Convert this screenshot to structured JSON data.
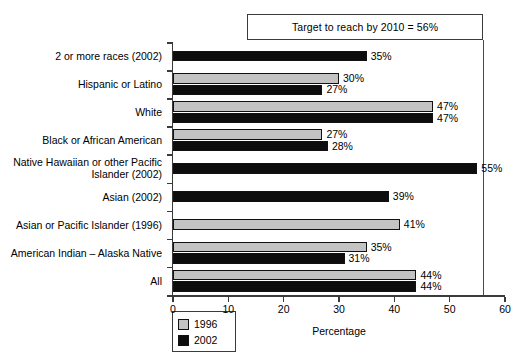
{
  "chart_data": {
    "type": "bar",
    "orientation": "horizontal",
    "title": "",
    "xlabel": "Percentage",
    "ylabel": "",
    "xlim": [
      0,
      60
    ],
    "xticks": [
      "0",
      "10",
      "20",
      "30",
      "40",
      "50",
      "60"
    ],
    "grid": false,
    "legend_position": "bottom-left",
    "annotation": "Target to reach by 2010 = 56%",
    "target_value": 56,
    "categories": [
      "2 or more races (2002)",
      "Hispanic or Latino",
      "White",
      "Black or African American",
      "Native Hawaiian or other Pacific\nIslander (2002)",
      "Asian (2002)",
      "Asian or Pacific Islander (1996)",
      "American Indian – Alaska Native",
      "All"
    ],
    "series": [
      {
        "name": "1996",
        "color": "#c3c3c3",
        "values": [
          null,
          30,
          47,
          27,
          null,
          null,
          41,
          35,
          44
        ],
        "labels": [
          "",
          "30%",
          "47%",
          "27%",
          "",
          "",
          "41%",
          "35%",
          "44%"
        ]
      },
      {
        "name": "2002",
        "color": "#0d0d0d",
        "values": [
          35,
          27,
          47,
          28,
          55,
          39,
          null,
          31,
          44
        ],
        "labels": [
          "35%",
          "27%",
          "47%",
          "28%",
          "55%",
          "39%",
          "",
          "31%",
          "44%"
        ]
      }
    ]
  },
  "legend": {
    "entries": [
      {
        "label": "1996",
        "color": "#c3c3c3"
      },
      {
        "label": "2002",
        "color": "#0d0d0d"
      }
    ]
  }
}
